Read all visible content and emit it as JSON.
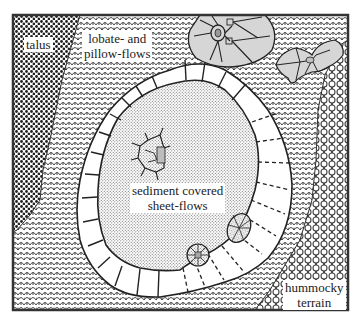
{
  "diagram": {
    "type": "geologic-map",
    "units": [
      {
        "id": "talus",
        "label": "talus",
        "pattern": "coarse-dots"
      },
      {
        "id": "lobate",
        "label_line1": "lobate- and",
        "label_line2": "pillow-flows",
        "pattern": "scales"
      },
      {
        "id": "sediment",
        "label_line1": "sediment covered",
        "label_line2": "sheet-flows",
        "pattern": "fine-stipple"
      },
      {
        "id": "hummocky",
        "label_line1": "hummocky",
        "label_line2": "terrain",
        "pattern": "circles"
      },
      {
        "id": "rim",
        "label": "",
        "pattern": "segmented-wall"
      },
      {
        "id": "collapse",
        "label": "",
        "pattern": "gray-polygons"
      }
    ],
    "colors": {
      "frame": "#333333",
      "ink": "#222222",
      "gray_fill": "#c8c8c8",
      "feature_fill": "#d9d9d9",
      "background": "#ffffff"
    }
  }
}
